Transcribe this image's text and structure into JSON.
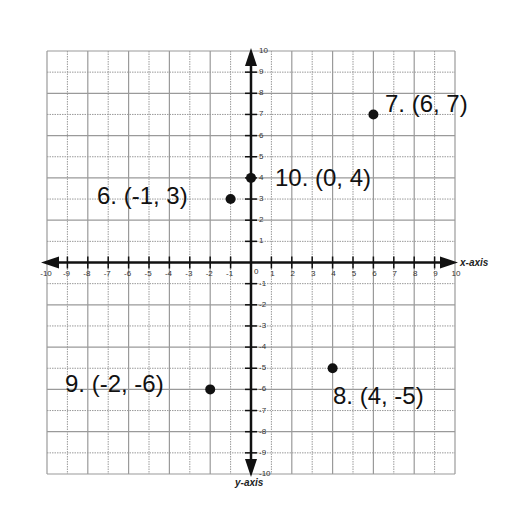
{
  "chart_data": {
    "type": "scatter",
    "title": "",
    "xlabel": "x-axis",
    "ylabel": "y-axis",
    "xlim": [
      -10,
      10
    ],
    "ylim": [
      -10,
      10
    ],
    "grid": true,
    "xticks": [
      -10,
      -9,
      -8,
      -7,
      -6,
      -5,
      -4,
      -3,
      -2,
      -1,
      0,
      1,
      2,
      3,
      4,
      5,
      6,
      7,
      8,
      9,
      10
    ],
    "yticks": [
      -10,
      -9,
      -8,
      -7,
      -6,
      -5,
      -4,
      -3,
      -2,
      -1,
      1,
      2,
      3,
      4,
      5,
      6,
      7,
      8,
      9,
      10
    ],
    "points": [
      {
        "id": "6",
        "x": -1,
        "y": 3,
        "label": "6.  (-1, 3)"
      },
      {
        "id": "7",
        "x": 6,
        "y": 7,
        "label": "7.  (6, 7)"
      },
      {
        "id": "8",
        "x": 4,
        "y": -5,
        "label": "8.  (4, -5)"
      },
      {
        "id": "9",
        "x": -2,
        "y": -6,
        "label": "9.  (-2, -6)"
      },
      {
        "id": "10",
        "x": 0,
        "y": 4,
        "label": "10.  (0, 4)"
      }
    ]
  },
  "labels": {
    "x_axis": "x-axis",
    "y_axis": "y-axis",
    "p6": "6.  (-1, 3)",
    "p7": "7.  (6, 7)",
    "p8": "8.  (4, -5)",
    "p9": "9.  (-2, -6)",
    "p10": "10.  (0, 4)"
  },
  "colors": {
    "grid": "#9a9a9a",
    "axis": "#111111",
    "point": "#111111",
    "background": "#ffffff"
  }
}
